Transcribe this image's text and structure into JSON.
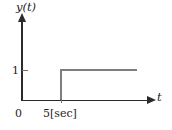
{
  "chart_data": {
    "type": "line",
    "title": "",
    "xlabel": "t",
    "ylabel": "y(t)",
    "x": [
      0,
      5,
      5,
      13
    ],
    "values": [
      0,
      0,
      1,
      1
    ],
    "series": [
      {
        "name": "y(t)",
        "x": [
          0,
          5,
          5,
          13
        ],
        "values": [
          0,
          0,
          1,
          1
        ]
      }
    ],
    "xlim": [
      0,
      13
    ],
    "ylim": [
      0,
      1.45
    ],
    "grid": false,
    "legend": null,
    "x_tick_labels": [
      "0",
      "5[sec]"
    ],
    "x_tick_values": [
      0,
      5
    ],
    "y_tick_labels": [
      "1"
    ],
    "y_tick_values": [
      1
    ],
    "step_time": 5,
    "step_amplitude": 1,
    "time_unit": "sec",
    "colors": {
      "axis": "#2b2b2b",
      "curve": "#7e7e7e",
      "tick": "#6f6f6f",
      "text": "#1d1d1d",
      "background": "#ffffff"
    }
  },
  "labels": {
    "y_axis": "y(t)",
    "x_axis": "t",
    "y_tick_one": "1",
    "x_tick_zero": "0",
    "x_tick_five": "5[sec]"
  }
}
